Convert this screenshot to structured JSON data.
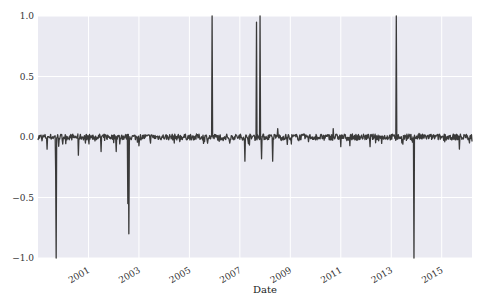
{
  "chart_data": {
    "type": "line",
    "title": "",
    "xlabel": "Date",
    "ylabel": "",
    "xlim": [
      1999.0,
      2016.2
    ],
    "ylim": [
      -1.0,
      1.0
    ],
    "grid": true,
    "legend": "none",
    "x_ticks": [
      {
        "value": 2001,
        "label": "2001"
      },
      {
        "value": 2003,
        "label": "2003"
      },
      {
        "value": 2005,
        "label": "2005"
      },
      {
        "value": 2007,
        "label": "2007"
      },
      {
        "value": 2009,
        "label": "2009"
      },
      {
        "value": 2011,
        "label": "2011"
      },
      {
        "value": 2013,
        "label": "2013"
      },
      {
        "value": 2015,
        "label": "2015"
      }
    ],
    "y_ticks": [
      {
        "value": 1.0,
        "label": "1.0"
      },
      {
        "value": 0.5,
        "label": "0.5"
      },
      {
        "value": 0.0,
        "label": "0.0"
      },
      {
        "value": -0.5,
        "label": "−0.5"
      },
      {
        "value": -1.0,
        "label": "−1.0"
      }
    ],
    "series": [
      {
        "name": "series",
        "color": "#3a3a3a",
        "baseline": {
          "start": 1999.0,
          "end": 2016.2,
          "step_years": 0.02,
          "noise_amplitude": 0.025,
          "seed": 7
        },
        "events": [
          {
            "x": 1999.35,
            "y": -0.1
          },
          {
            "x": 1999.7,
            "y": -0.28
          },
          {
            "x": 1999.72,
            "y": -1.0
          },
          {
            "x": 2000.6,
            "y": -0.15
          },
          {
            "x": 2001.5,
            "y": -0.12
          },
          {
            "x": 2002.1,
            "y": -0.12
          },
          {
            "x": 2002.55,
            "y": -0.55
          },
          {
            "x": 2002.6,
            "y": -0.8
          },
          {
            "x": 2004.4,
            "y": -0.05
          },
          {
            "x": 2005.9,
            "y": 1.0
          },
          {
            "x": 2006.6,
            "y": -0.05
          },
          {
            "x": 2007.2,
            "y": -0.2
          },
          {
            "x": 2007.65,
            "y": 0.95
          },
          {
            "x": 2007.8,
            "y": 1.0
          },
          {
            "x": 2007.85,
            "y": -0.18
          },
          {
            "x": 2008.3,
            "y": -0.2
          },
          {
            "x": 2008.5,
            "y": 0.07
          },
          {
            "x": 2010.7,
            "y": 0.07
          },
          {
            "x": 2011.0,
            "y": -0.08
          },
          {
            "x": 2013.2,
            "y": 1.0
          },
          {
            "x": 2013.9,
            "y": -1.0
          },
          {
            "x": 2014.1,
            "y": 0.03
          },
          {
            "x": 2015.7,
            "y": -0.1
          }
        ]
      }
    ]
  }
}
